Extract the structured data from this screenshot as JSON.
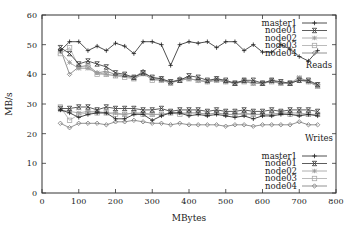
{
  "chart_data": {
    "type": "line",
    "title": "",
    "xlabel": "MBytes",
    "ylabel": "MB/s",
    "xlim": [
      0,
      800
    ],
    "ylim": [
      0,
      60
    ],
    "xticks": [
      0,
      100,
      200,
      300,
      400,
      500,
      600,
      700,
      800
    ],
    "yticks": [
      0,
      10,
      20,
      30,
      40,
      50,
      60
    ],
    "grid": false,
    "x": [
      50,
      75,
      100,
      125,
      150,
      175,
      200,
      225,
      250,
      275,
      300,
      325,
      350,
      375,
      400,
      425,
      450,
      475,
      500,
      525,
      550,
      575,
      600,
      625,
      650,
      675,
      700,
      725,
      750
    ],
    "annotations": [
      {
        "text": "Reads",
        "x": 735,
        "y": 37.5
      },
      {
        "text": "Writes",
        "x": 735,
        "y": 18.5
      }
    ],
    "legends": [
      {
        "group": "Reads",
        "position": "top-right",
        "entries": [
          "master1",
          "node01",
          "node02",
          "node03",
          "node04"
        ]
      },
      {
        "group": "Writes",
        "position": "bottom-right",
        "entries": [
          "master1",
          "node01",
          "node02",
          "node03",
          "node04"
        ]
      }
    ],
    "series": [
      {
        "name": "master1",
        "group": "Reads",
        "marker": "plus",
        "color": "#222222",
        "values": [
          48,
          51,
          51,
          48,
          49.5,
          48,
          50.5,
          49.5,
          47,
          51,
          51,
          50,
          43,
          50,
          51,
          50.5,
          51,
          49,
          51,
          51,
          48,
          50,
          47.5,
          47.5,
          50,
          48.5,
          46,
          44.5,
          48
        ]
      },
      {
        "name": "node01",
        "group": "Reads",
        "marker": "x-box",
        "color": "#333333",
        "values": [
          49,
          47,
          43.5,
          44.5,
          43.5,
          42.5,
          40.5,
          40,
          39,
          40.5,
          39,
          38.5,
          37.5,
          38,
          39.5,
          39,
          38,
          38.5,
          38,
          37,
          38,
          38,
          37,
          38,
          37.5,
          37,
          38,
          38,
          36.5
        ]
      },
      {
        "name": "node02",
        "group": "Reads",
        "marker": "star",
        "color": "#999999",
        "values": [
          47.5,
          44,
          42,
          42,
          40.5,
          40,
          39.5,
          39.5,
          38.5,
          40,
          38.5,
          38,
          37.5,
          38,
          38.5,
          38,
          37.5,
          38,
          37.5,
          37,
          37.5,
          37,
          37,
          37.5,
          37,
          37,
          39,
          37.5,
          36
        ]
      },
      {
        "name": "node03",
        "group": "Reads",
        "marker": "square",
        "color": "#aaaaaa",
        "values": [
          47,
          49,
          42.5,
          42.5,
          40,
          40,
          39.5,
          39,
          38.5,
          40.5,
          38,
          38,
          37,
          38,
          38.5,
          38,
          37.5,
          38,
          37.5,
          37,
          37.5,
          37,
          37,
          37.5,
          37,
          37,
          38.5,
          37.5,
          36
        ]
      },
      {
        "name": "node04",
        "group": "Reads",
        "marker": "diamond",
        "color": "#777777",
        "values": [
          48.5,
          40,
          42.5,
          43,
          40.5,
          41,
          40,
          39.5,
          39,
          41,
          38.5,
          38.5,
          37,
          38.5,
          38.5,
          38,
          37.5,
          38.5,
          37.5,
          37,
          38,
          37,
          37,
          38,
          37,
          37,
          38,
          37.5,
          36.5
        ]
      },
      {
        "name": "master1",
        "group": "Writes",
        "marker": "plus",
        "color": "#222222",
        "values": [
          28,
          27,
          25.5,
          26.5,
          27,
          27,
          25,
          25,
          26.5,
          26.5,
          24.5,
          26,
          27,
          27,
          26,
          26.5,
          26,
          26.5,
          26,
          25.5,
          26,
          25,
          26,
          26,
          26.5,
          26.5,
          26,
          26.5,
          26
        ]
      },
      {
        "name": "node01",
        "group": "Writes",
        "marker": "x-box",
        "color": "#333333",
        "values": [
          28.5,
          28.5,
          29,
          29,
          28,
          29,
          28.5,
          28.5,
          28.5,
          28,
          28,
          28.5,
          27.5,
          28,
          28,
          28,
          27.5,
          28,
          27.5,
          27.5,
          28,
          27.5,
          27.5,
          28,
          27.5,
          28,
          28,
          28,
          27.5
        ]
      },
      {
        "name": "node02",
        "group": "Writes",
        "marker": "star",
        "color": "#999999",
        "values": [
          28,
          27.5,
          27,
          27.5,
          27.5,
          27,
          27,
          26.5,
          27,
          27,
          26.5,
          26.5,
          27,
          27,
          27,
          27,
          26.5,
          27,
          26.5,
          26.5,
          27,
          26.5,
          26.5,
          26.5,
          27,
          27,
          27,
          26.5,
          26.5
        ]
      },
      {
        "name": "node03",
        "group": "Writes",
        "marker": "square",
        "color": "#aaaaaa",
        "values": [
          29,
          24.5,
          26.5,
          27,
          27,
          27,
          26.5,
          26.5,
          27,
          26.5,
          26.5,
          26.5,
          27,
          26.5,
          27,
          27,
          26.5,
          27,
          26.5,
          26.5,
          26.5,
          26.5,
          26.5,
          26.5,
          27,
          26.5,
          26.5,
          26.5,
          26.5
        ]
      },
      {
        "name": "node04",
        "group": "Writes",
        "marker": "diamond",
        "color": "#777777",
        "values": [
          23.5,
          22,
          23.5,
          23.5,
          23.5,
          23,
          24,
          24,
          24.5,
          24,
          23.5,
          23.5,
          23,
          23.5,
          23,
          23,
          23,
          23,
          22.5,
          23,
          23,
          22.5,
          23,
          23,
          23,
          23,
          24,
          23,
          23
        ]
      }
    ]
  },
  "labels": {
    "xlabel": "MBytes",
    "ylabel": "MB/s",
    "reads": "Reads",
    "writes": "Writes"
  }
}
